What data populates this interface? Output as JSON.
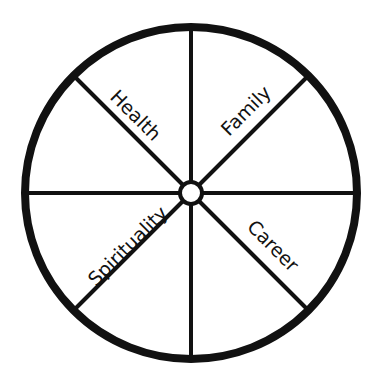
{
  "diagram": {
    "type": "wheel",
    "center": [
      191,
      193
    ],
    "radius": 166,
    "rim_stroke": 8,
    "spoke_stroke": 4,
    "hub_radius": 11,
    "colors": {
      "line": "#111111",
      "background": "#ffffff"
    },
    "segments": [
      {
        "label": "Health",
        "angle_deg": 225
      },
      {
        "label": "Family",
        "angle_deg": 315
      },
      {
        "label": "Career",
        "angle_deg": 45
      },
      {
        "label": "Spirituality",
        "angle_deg": 135
      }
    ],
    "labels": {
      "health": "Health",
      "family": "Family",
      "career": "Career",
      "spirituality": "Spirituality"
    }
  }
}
